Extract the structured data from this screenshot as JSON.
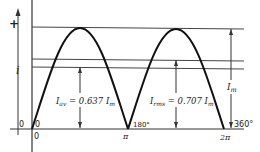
{
  "diagram": {
    "type": "rectified-sine-waveform",
    "axis": {
      "y_label": "i",
      "positive_sign": "+",
      "origin_left": "0",
      "origin_inner": "0",
      "origin_below": "0"
    },
    "x_ticks": [
      {
        "degrees": "180°",
        "radians": "π"
      },
      {
        "degrees": "360°",
        "radians": "2π"
      }
    ],
    "annotations": {
      "average": {
        "symbol": "I",
        "subscript": "av",
        "text": " = 0.637 ",
        "ref": "I",
        "ref_sub": "m"
      },
      "rms": {
        "symbol": "I",
        "subscript": "rms",
        "text": " = 0.707 ",
        "ref": "I",
        "ref_sub": "m"
      },
      "peak": {
        "symbol": "I",
        "subscript": "m"
      }
    },
    "levels": {
      "peak": 1.0,
      "rms": 0.707,
      "average": 0.637
    },
    "colors": {
      "stroke": "#222222",
      "background": "#ffffff"
    }
  }
}
